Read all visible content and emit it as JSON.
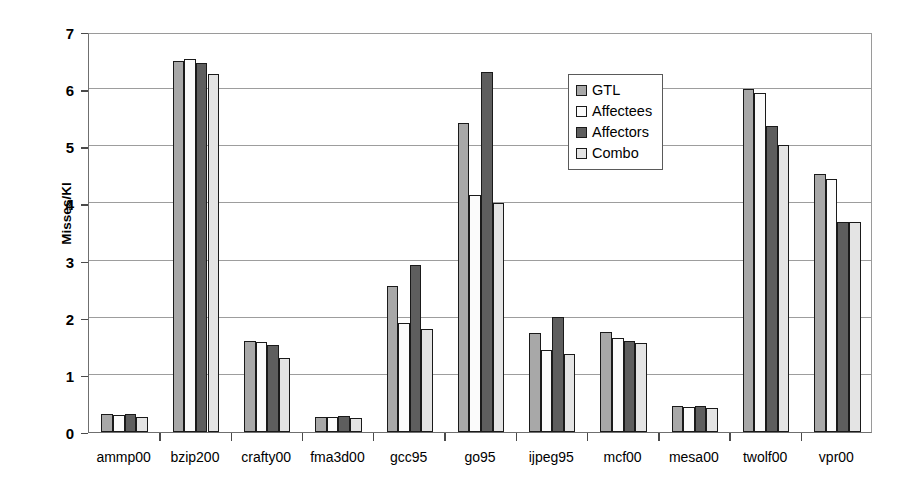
{
  "chart_data": {
    "type": "bar",
    "title": "",
    "xlabel": "",
    "ylabel": "Misses/KI",
    "ylim": [
      0,
      7
    ],
    "ytick_values": [
      0,
      1,
      2,
      3,
      4,
      5,
      6,
      7
    ],
    "ytick_labels": [
      "0",
      "1",
      "2",
      "3",
      "4",
      "5",
      "6",
      "7"
    ],
    "grid": true,
    "legend_position": "upper-center-right",
    "categories": [
      "ammp00",
      "bzip200",
      "crafty00",
      "fma3d00",
      "gcc95",
      "go95",
      "ijpeg95",
      "mcf00",
      "mesa00",
      "twolf00",
      "vpr00"
    ],
    "series": [
      {
        "name": "GTL",
        "color": "#a8a8a8",
        "values": [
          0.31,
          6.5,
          1.6,
          0.27,
          2.55,
          5.4,
          1.73,
          1.75,
          0.46,
          6.0,
          4.52
        ]
      },
      {
        "name": "Affectees",
        "color": "#fbfbfb",
        "values": [
          0.29,
          6.52,
          1.58,
          0.27,
          1.9,
          4.15,
          1.43,
          1.65,
          0.44,
          5.93,
          4.42
        ]
      },
      {
        "name": "Affectors",
        "color": "#5e5e5e",
        "values": [
          0.31,
          6.45,
          1.52,
          0.28,
          2.93,
          6.3,
          2.02,
          1.6,
          0.45,
          5.35,
          3.67
        ]
      },
      {
        "name": "Combo",
        "color": "#e4e4e4",
        "values": [
          0.26,
          6.27,
          1.29,
          0.25,
          1.8,
          4.0,
          1.37,
          1.56,
          0.42,
          5.02,
          3.67
        ]
      }
    ]
  },
  "legend": {
    "items": [
      {
        "label": "GTL"
      },
      {
        "label": "Affectees"
      },
      {
        "label": "Affectors"
      },
      {
        "label": "Combo"
      }
    ]
  }
}
